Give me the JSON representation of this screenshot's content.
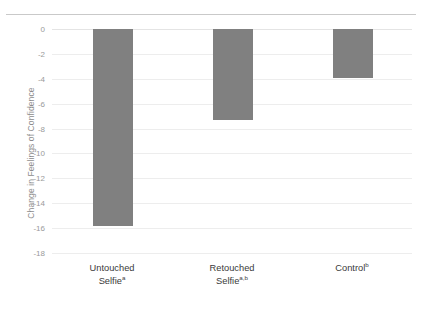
{
  "chart_data": {
    "type": "bar",
    "title": "",
    "xlabel": "",
    "ylabel": "Change in Feelings of Confidence",
    "categories": [
      "Untouched Selfie",
      "Retouched Selfie",
      "Control"
    ],
    "category_superscripts": [
      "a",
      "a,b",
      "b"
    ],
    "values": [
      -15.8,
      -7.3,
      -3.9
    ],
    "ylim": [
      -18,
      0
    ],
    "yticks": [
      0,
      -2,
      -4,
      -6,
      -8,
      -10,
      -12,
      -14,
      -16,
      -18
    ],
    "ytick_labels": [
      "0",
      "-2",
      "-4",
      "-6",
      "-8",
      "-10",
      "-12",
      "-14",
      "-16",
      "-18"
    ],
    "grid": true,
    "legend": "none",
    "bar_color": "#808080",
    "gridline_color": "#ededed",
    "tick_label_color": "#9a9a9a",
    "axis_title_color": "#8c8c8c"
  },
  "axis": {
    "y_title": "Change in Feelings of Confidence"
  }
}
